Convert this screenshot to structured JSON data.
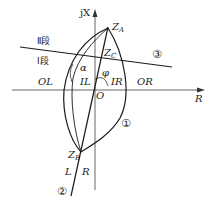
{
  "diagram": {
    "type": "impedance-relay characteristic (R-X plane)",
    "axes": {
      "x_label": "R",
      "y_label": "jX",
      "origin_label": "O"
    },
    "points": {
      "za": "Z",
      "za_sub": "A",
      "zb": "Z",
      "zb_sub": "B",
      "zc": "Z",
      "zc_sub": "C"
    },
    "angles": {
      "alpha": "α",
      "phi": "φ"
    },
    "zones": {
      "stage2": "Ⅱ段",
      "stage1": "Ⅰ段",
      "ol": "OL",
      "il": "IL",
      "ir": "IR",
      "or": "OR",
      "l": "L",
      "r": "R"
    },
    "curve_markers": {
      "c1": "①",
      "c2": "②",
      "c3": "③"
    },
    "colors": {
      "stroke": "#1a1a1a",
      "axis": "#555555",
      "background": "#ffffff"
    }
  }
}
